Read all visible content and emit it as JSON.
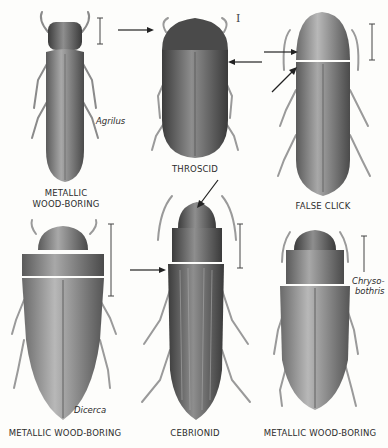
{
  "plate": {
    "specimens": [
      {
        "common_name": "METALLIC WOOD-BORING",
        "common_name_lines": [
          "METALLIC",
          "WOOD-BORING"
        ],
        "genus": "Agrilus",
        "position": "top-left"
      },
      {
        "common_name": "THROSCID",
        "genus": "",
        "position": "top-center"
      },
      {
        "common_name": "FALSE CLICK",
        "genus": "",
        "position": "top-right"
      },
      {
        "common_name": "METALLIC WOOD-BORING",
        "genus": "Dicerca",
        "position": "bottom-left"
      },
      {
        "common_name": "CEBRIONID",
        "genus": "",
        "position": "bottom-center"
      },
      {
        "common_name": "METALLIC WOOD-BORING",
        "genus": "Chryso-bothris",
        "genus_lines": [
          "Chryso-",
          "bothris"
        ],
        "position": "bottom-right"
      }
    ],
    "colors": {
      "ink": "#2c2c2c",
      "body_dark": "#4a4a4a",
      "body_mid": "#8a8a8a",
      "legs": "#9a9a9a",
      "background": "#fdfdfb"
    }
  }
}
